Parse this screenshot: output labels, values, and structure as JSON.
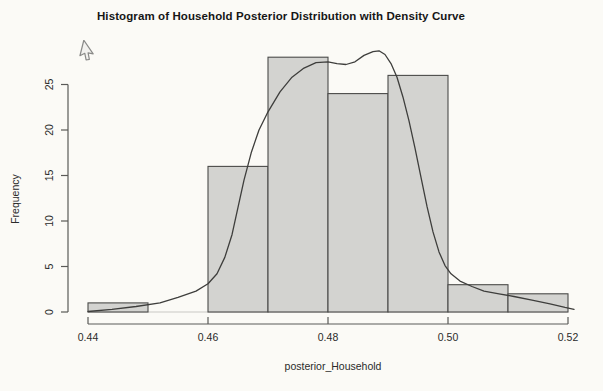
{
  "title": "Histogram of Household Posterior Distribution with Density Curve",
  "cursor": {
    "icon": "arrow-pointer",
    "x": 80,
    "y": 43
  },
  "chart_data": {
    "type": "bar",
    "subtype": "histogram-with-density-overlay",
    "title": "Histogram of Household Posterior Distribution with Density Curve",
    "xlabel": "posterior_Household",
    "ylabel": "Frequency",
    "xlim": [
      0.44,
      0.52
    ],
    "ylim": [
      0,
      29
    ],
    "grid": "off",
    "legend": "none",
    "x_tick_labels": [
      "0.44",
      "0.46",
      "0.48",
      "0.50",
      "0.52"
    ],
    "y_tick_labels": [
      "0",
      "5",
      "10",
      "15",
      "20",
      "25"
    ],
    "bin_width": 0.01,
    "bin_edges": [
      0.44,
      0.45,
      0.46,
      0.47,
      0.48,
      0.49,
      0.5,
      0.51,
      0.52
    ],
    "categories": [
      "0.44-0.45",
      "0.45-0.46",
      "0.46-0.47",
      "0.47-0.48",
      "0.48-0.49",
      "0.49-0.50",
      "0.50-0.51",
      "0.51-0.52"
    ],
    "values": [
      1,
      0,
      16,
      28,
      24,
      26,
      3,
      2
    ],
    "series": [
      {
        "name": "Frequency histogram",
        "values": [
          1,
          0,
          16,
          28,
          24,
          26,
          3,
          2
        ]
      },
      {
        "name": "Density curve (frequency scale)",
        "points": [
          [
            0.44,
            0.05
          ],
          [
            0.444,
            0.3
          ],
          [
            0.448,
            0.6
          ],
          [
            0.452,
            1.0
          ],
          [
            0.455,
            1.6
          ],
          [
            0.458,
            2.3
          ],
          [
            0.46,
            3.1
          ],
          [
            0.4615,
            4.2
          ],
          [
            0.4628,
            6.0
          ],
          [
            0.464,
            8.5
          ],
          [
            0.465,
            11.5
          ],
          [
            0.466,
            14.5
          ],
          [
            0.4672,
            17.5
          ],
          [
            0.4685,
            20.0
          ],
          [
            0.47,
            22.0
          ],
          [
            0.472,
            24.2
          ],
          [
            0.474,
            25.8
          ],
          [
            0.476,
            26.8
          ],
          [
            0.478,
            27.4
          ],
          [
            0.48,
            27.5
          ],
          [
            0.4815,
            27.3
          ],
          [
            0.483,
            27.2
          ],
          [
            0.4845,
            27.5
          ],
          [
            0.486,
            28.2
          ],
          [
            0.4875,
            28.6
          ],
          [
            0.4885,
            28.7
          ],
          [
            0.4895,
            28.3
          ],
          [
            0.4905,
            27.3
          ],
          [
            0.4915,
            25.8
          ],
          [
            0.4925,
            23.6
          ],
          [
            0.4935,
            21.0
          ],
          [
            0.4945,
            18.0
          ],
          [
            0.4955,
            14.8
          ],
          [
            0.4965,
            11.6
          ],
          [
            0.4975,
            8.8
          ],
          [
            0.4985,
            6.6
          ],
          [
            0.4995,
            5.1
          ],
          [
            0.5005,
            4.2
          ],
          [
            0.502,
            3.4
          ],
          [
            0.504,
            2.8
          ],
          [
            0.506,
            2.3
          ],
          [
            0.5085,
            2.0
          ],
          [
            0.511,
            1.7
          ],
          [
            0.514,
            1.3
          ],
          [
            0.517,
            0.9
          ],
          [
            0.5195,
            0.5
          ],
          [
            0.521,
            0.3
          ]
        ]
      }
    ],
    "colors": {
      "background": "#fbfaf6",
      "bar_fill": "#d3d3d0",
      "bar_border": "#4b4b49",
      "density_curve": "#3e3e3c",
      "axis": "#5a5a58",
      "text": "#2a2a2a"
    }
  }
}
